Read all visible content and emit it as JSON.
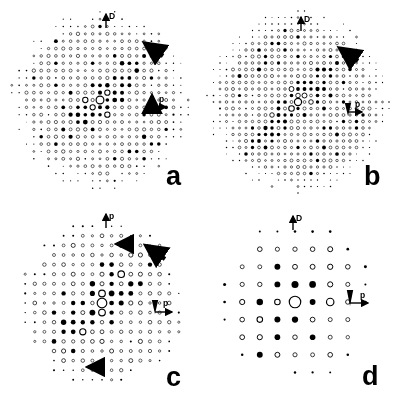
{
  "figure": {
    "kind": "electron-diffraction-pattern-montage",
    "width": 396,
    "height": 406,
    "background": "#ffffff",
    "ink": "#000000",
    "panel_count": 4
  },
  "chart_data": {
    "type": "scatter",
    "title": "",
    "xlabel": "",
    "ylabel": "",
    "panels": [
      {
        "id": "a",
        "label": "a",
        "label_pos": [
          166,
          163
        ],
        "center": [
          100,
          100
        ],
        "radius": 86,
        "lattice": {
          "a1": [
            7.35,
            0.0
          ],
          "a2": [
            0.0,
            7.35
          ],
          "rows": 26,
          "cols": 26
        },
        "spot_size": {
          "min": 0.5,
          "max": 3.4
        },
        "density": "very-high",
        "vectors": [
          {
            "name": "D",
            "label": "D",
            "from": [
              106,
              28
            ],
            "to": [
              106,
              14
            ],
            "label_pos": [
              109,
              13
            ]
          },
          {
            "name": "p",
            "label": "p",
            "from": [
              152,
              107
            ],
            "to": [
              166,
              107
            ],
            "label_pos": [
              159,
              96
            ]
          }
        ],
        "markers": [
          {
            "name": "diagonal-arrow",
            "shape": "arrow-diagonal",
            "x": 163,
            "y": 56,
            "angle": 215,
            "length": 22
          },
          {
            "name": "vertical-arrow",
            "shape": "arrow-up",
            "x": 152,
            "y": 96,
            "length": 14
          }
        ]
      },
      {
        "id": "b",
        "label": "b",
        "label_pos": [
          364,
          163
        ],
        "center": [
          298,
          102
        ],
        "radius": 88,
        "lattice": {
          "a1": [
            6.5,
            0.0
          ],
          "a2": [
            0.0,
            6.5
          ],
          "rows": 30,
          "cols": 30
        },
        "spot_size": {
          "min": 0.5,
          "max": 3.1
        },
        "density": "very-high",
        "vectors": [
          {
            "name": "D",
            "label": "D",
            "from": [
              301,
              31
            ],
            "to": [
              301,
              17
            ],
            "label_pos": [
              304,
              16
            ]
          },
          {
            "name": "p",
            "label": "p",
            "from": [
              348,
              112
            ],
            "to": [
              362,
              112
            ],
            "label_pos": [
              355,
              101
            ]
          }
        ],
        "markers": [
          {
            "name": "diagonal-arrow",
            "shape": "arrow-diagonal",
            "x": 358,
            "y": 61,
            "angle": 215,
            "length": 22
          },
          {
            "name": "vertical-arrow",
            "shape": "arrow-down",
            "x": 348,
            "y": 103,
            "length": 13
          }
        ]
      },
      {
        "id": "c",
        "label": "c",
        "label_pos": [
          166,
          364
        ],
        "center": [
          102,
          303
        ],
        "radius": 82,
        "lattice": {
          "a1": [
            9.6,
            0.0
          ],
          "a2": [
            0.0,
            9.6
          ],
          "rows": 20,
          "cols": 20
        },
        "spot_size": {
          "min": 0.7,
          "max": 4.2
        },
        "density": "high",
        "vectors": [
          {
            "name": "D",
            "label": "p",
            "from": [
              106,
              228
            ],
            "to": [
              106,
              214
            ],
            "label_pos": [
              109,
              213
            ]
          },
          {
            "name": "p",
            "label": "p",
            "from": [
              155,
              312
            ],
            "to": [
              172,
              312
            ],
            "label_pos": [
              163,
              300
            ]
          }
        ],
        "markers": [
          {
            "name": "diagonal-arrow",
            "shape": "arrow-diagonal",
            "x": 165,
            "y": 259,
            "angle": 215,
            "length": 23
          },
          {
            "name": "vertical-arrow",
            "shape": "arrow-down",
            "x": 155,
            "y": 300,
            "length": 14
          },
          {
            "name": "upper-left-arrow",
            "shape": "arrow-left",
            "x": 117,
            "y": 244,
            "length": 13
          },
          {
            "name": "lower-left-arrow",
            "shape": "arrow-left",
            "x": 88,
            "y": 367,
            "length": 13
          }
        ]
      },
      {
        "id": "d",
        "label": "d",
        "label_pos": [
          362,
          363
        ],
        "center": [
          295,
          302
        ],
        "radius": 80,
        "lattice": {
          "a1": [
            17.6,
            0.0
          ],
          "a2": [
            0.0,
            17.6
          ],
          "rows": 11,
          "cols": 11
        },
        "spot_size": {
          "min": 1.2,
          "max": 5.0
        },
        "density": "low",
        "vectors": [
          {
            "name": "D",
            "label": "D",
            "from": [
              293,
              230
            ],
            "to": [
              293,
              216
            ],
            "label_pos": [
              296,
              215
            ]
          },
          {
            "name": "p",
            "label": "p",
            "from": [
              350,
              303
            ],
            "to": [
              368,
              303
            ],
            "label_pos": [
              360,
              292
            ]
          }
        ],
        "markers": [
          {
            "name": "vertical-arrow",
            "shape": "arrow-down",
            "x": 350,
            "y": 290,
            "length": 16
          }
        ]
      }
    ],
    "legend": {
      "position": "none",
      "entries": [
        {
          "symbol": "open-circle",
          "meaning": "weak reflection"
        },
        {
          "symbol": "filled-dot",
          "meaning": "strong reflection"
        }
      ]
    },
    "annotations": [
      {
        "text": "D",
        "meaning": "reciprocal lattice vector D"
      },
      {
        "text": "p",
        "meaning": "reciprocal lattice vector p"
      }
    ],
    "grid": false,
    "axis_visible": false
  }
}
